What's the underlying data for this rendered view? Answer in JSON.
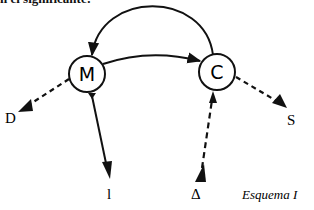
{
  "caption_top": "n el significante:",
  "diagram": {
    "title": "Esquema I",
    "nodes": [
      {
        "id": "M",
        "label": "M",
        "cx": 87,
        "cy": 74,
        "r": 18
      },
      {
        "id": "C",
        "label": "C",
        "cx": 217,
        "cy": 72,
        "r": 18
      }
    ],
    "external_labels": {
      "D": "D",
      "S": "S",
      "l": "l",
      "delta": "Δ"
    },
    "edges": [
      {
        "from": "M",
        "to": "C",
        "style": "solid",
        "shape": "curved"
      },
      {
        "from": "C",
        "to": "M",
        "style": "solid",
        "shape": "arc"
      },
      {
        "from": "M",
        "to": "D",
        "style": "dashed"
      },
      {
        "from": "C",
        "to": "S",
        "style": "dashed"
      },
      {
        "from": "M",
        "to": "l",
        "style": "solid"
      },
      {
        "from": "Δ",
        "to": "C",
        "style": "dashed"
      }
    ],
    "colors": {
      "ink": "#111111",
      "background": "#ffffff"
    }
  }
}
